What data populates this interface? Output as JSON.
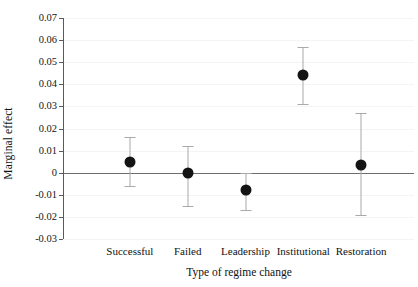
{
  "chart_data": {
    "type": "scatter",
    "title": "",
    "subtitle": "",
    "xlabel": "Type of regime change",
    "ylabel": "Marginal effect",
    "categories": [
      "Successful",
      "Failed",
      "Leadership",
      "Institutional",
      "Restoration"
    ],
    "values": [
      0.005,
      0.0,
      -0.008,
      0.044,
      0.0035
    ],
    "error_low": [
      -0.006,
      -0.015,
      -0.017,
      0.031,
      -0.019
    ],
    "error_high": [
      0.016,
      0.012,
      0.0,
      0.057,
      0.027
    ],
    "ylim": [
      -0.03,
      0.07
    ],
    "yticks": [
      0.07,
      0.06,
      0.05,
      0.04,
      0.03,
      0.02,
      0.01,
      0,
      -0.01,
      -0.02,
      -0.03
    ],
    "ytick_labels": [
      "0.07",
      "0.06",
      "0.05",
      "0.04",
      "0.03",
      "0.02",
      "0.01",
      "0",
      "-0.01",
      "-0.02",
      "-0.03"
    ],
    "grid": true,
    "legend": null,
    "reference_line": 0,
    "annotations": [],
    "colors": {
      "point": "#141414",
      "error_bar": "#a9a9a9",
      "axis": "#5a5a5a",
      "zero_line": "#6e6e6e",
      "grid": "#f4f4f4",
      "background": "#ffffff",
      "text": "#111111"
    }
  }
}
